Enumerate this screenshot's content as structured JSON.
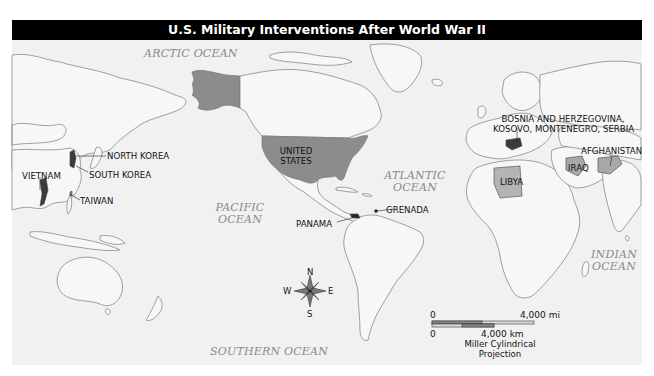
{
  "map": {
    "title": "U.S. Military Interventions After World War II",
    "projection": "Miller Cylindrical\nProjection",
    "projection_line1": "Miller Cylindrical",
    "projection_line2": "Projection",
    "colors": {
      "background": "#f1f1f1",
      "land_stroke": "#7a7a7a",
      "highlight_fill": "#8c8c8c",
      "light_highlight_fill": "#b4b4b4",
      "dark_highlight_fill": "#3a3a3a",
      "title_bar": "#000000",
      "ocean_label": "#8a8a8a"
    },
    "oceans": [
      {
        "name": "ARCTIC OCEAN",
        "line1": "ARCTIC OCEAN",
        "line2": ""
      },
      {
        "name": "PACIFIC OCEAN",
        "line1": "PACIFIC",
        "line2": "OCEAN"
      },
      {
        "name": "ATLANTIC OCEAN",
        "line1": "ATLANTIC",
        "line2": "OCEAN"
      },
      {
        "name": "INDIAN OCEAN",
        "line1": "INDIAN",
        "line2": "OCEAN"
      },
      {
        "name": "SOUTHERN OCEAN",
        "line1": "SOUTHERN OCEAN",
        "line2": ""
      }
    ],
    "interventions": [
      {
        "label": "UNITED STATES",
        "line1": "UNITED",
        "line2": "STATES"
      },
      {
        "label": "NORTH KOREA"
      },
      {
        "label": "SOUTH KOREA"
      },
      {
        "label": "VIETNAM"
      },
      {
        "label": "TAIWAN"
      },
      {
        "label": "PANAMA"
      },
      {
        "label": "GRENADA"
      },
      {
        "label": "LIBYA"
      },
      {
        "label": "IRAQ"
      },
      {
        "label": "AFGHANISTAN"
      },
      {
        "label": "BOSNIA AND HERZEGOVINA, KOSOVO, MONTENEGRO, SERBIA",
        "line1": "BOSNIA AND HERZEGOVINA,",
        "line2": "KOSOVO, MONTENEGRO, SERBIA"
      }
    ],
    "scale": {
      "mi_start": "0",
      "mi_end": "4,000 mi",
      "km_start": "0",
      "km_end": "4,000 km"
    },
    "compass": {
      "n": "N",
      "s": "S",
      "e": "E",
      "w": "W"
    }
  }
}
